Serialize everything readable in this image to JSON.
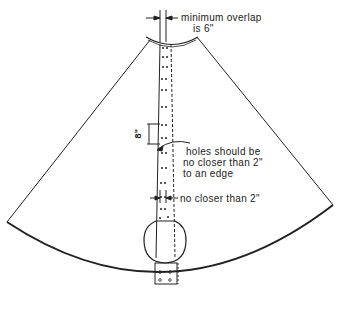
{
  "diagram": {
    "title": "",
    "type": "pattern-layout",
    "annotations": {
      "overlap": {
        "line1": "minimum overlap",
        "line2": "is 6\""
      },
      "hole_spacing": "8\"",
      "hole_edge": {
        "line1": "holes should be",
        "line2": "no closer than 2\"",
        "line3": "to an edge"
      },
      "hole_gap": "no closer than 2\""
    },
    "colors": {
      "stroke": "#222222",
      "background": "#ffffff"
    }
  }
}
